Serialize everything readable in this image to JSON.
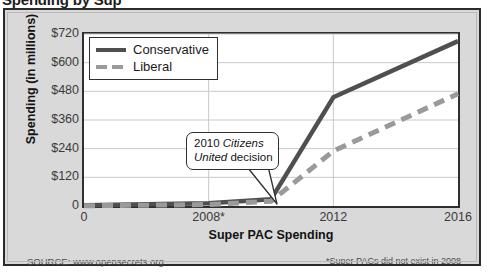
{
  "document": {
    "title_partial": "Spending by Sup"
  },
  "footer": {
    "source": "SOURCE: www.opensecrets.org",
    "footnote": "*Super PACs did not exist in 2008"
  },
  "annotation": {
    "line1_prefix": "2010 ",
    "line1_italic": "Citizens",
    "line2_italic": "United",
    "line2_suffix": " decision",
    "full_text": "2010 Citizens United decision",
    "points_to_year": 2010
  },
  "colors": {
    "conservative": "#4f4f4f",
    "liberal": "#9a9a9a",
    "panel_background": "#ffffff",
    "figure_background": "#d9d9d9",
    "frame_border": "#2b2b2b",
    "gridline": "#c9c9c9",
    "axis_text": "#3a3a3a"
  },
  "chart_data": {
    "type": "line",
    "title": "Spending by Sup",
    "xlabel": "Super PAC Spending",
    "ylabel": "Spending (in millions)",
    "x": [
      2004,
      2008,
      2010,
      2012,
      2016
    ],
    "xtick_labels": [
      "0",
      "2008*",
      "2012",
      "2016"
    ],
    "xtick_values": [
      2004,
      2008,
      2012,
      2016
    ],
    "ytick_labels": [
      "$720",
      "$600",
      "$480",
      "$360",
      "$240",
      "$120",
      "0"
    ],
    "ytick_values": [
      720,
      600,
      480,
      360,
      240,
      120,
      0
    ],
    "xlim": [
      2004,
      2016
    ],
    "ylim": [
      0,
      720
    ],
    "grid": true,
    "legend_position": "top-left",
    "series": [
      {
        "name": "Conservative",
        "style": "solid",
        "color": "#4f4f4f",
        "values": [
          3,
          12,
          28,
          455,
          690
        ]
      },
      {
        "name": "Liberal",
        "style": "dashed",
        "color": "#9a9a9a",
        "values": [
          1,
          6,
          20,
          230,
          470
        ]
      }
    ],
    "annotations": [
      {
        "text": "2010 Citizens United decision",
        "x": 2010,
        "y": 28
      }
    ]
  }
}
